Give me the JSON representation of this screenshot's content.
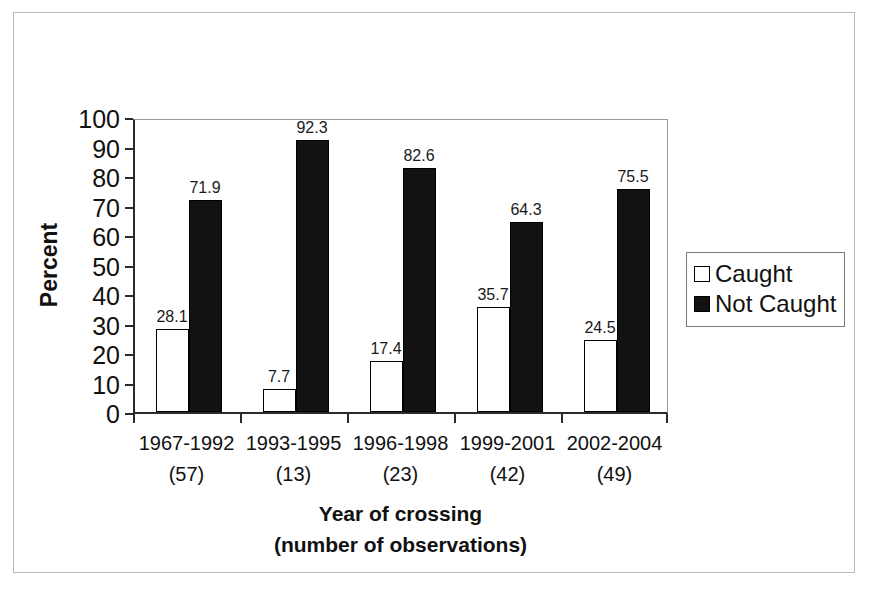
{
  "chart_data": {
    "type": "bar",
    "title": "",
    "xlabel": "Year of crossing (number of observations)",
    "xlabel_line1": "Year of crossing",
    "xlabel_line2": "(number of observations)",
    "ylabel": "Percent",
    "ylim": [
      0,
      100
    ],
    "ytick_step": 10,
    "ytick_labels": [
      "100",
      "90",
      "80",
      "70",
      "60",
      "50",
      "40",
      "30",
      "20",
      "10",
      "0"
    ],
    "ytick_values": [
      100,
      90,
      80,
      70,
      60,
      50,
      40,
      30,
      20,
      10,
      0
    ],
    "grid": false,
    "legend_position": "right",
    "categories": [
      "1967-1992",
      "1993-1995",
      "1996-1998",
      "1999-2001",
      "2002-2004"
    ],
    "category_counts": [
      "(57)",
      "(13)",
      "(23)",
      "(42)",
      "(49)"
    ],
    "series": [
      {
        "name": "Caught",
        "color": "#ffffff",
        "values": [
          28.1,
          7.7,
          17.4,
          35.7,
          24.5
        ],
        "labels": [
          "28.1",
          "7.7",
          "17.4",
          "35.7",
          "24.5"
        ]
      },
      {
        "name": "Not Caught",
        "color": "#121212",
        "values": [
          71.9,
          92.3,
          82.6,
          64.3,
          75.5
        ],
        "labels": [
          "71.9",
          "92.3",
          "82.6",
          "64.3",
          "75.5"
        ]
      }
    ]
  },
  "legend": {
    "items": [
      {
        "label": "Caught",
        "swatch": "white-square"
      },
      {
        "label": "Not Caught",
        "swatch": "black-square"
      }
    ]
  },
  "axes": {
    "y_title": "Percent",
    "x_title_line1": "Year of crossing",
    "x_title_line2": "(number of observations)"
  }
}
